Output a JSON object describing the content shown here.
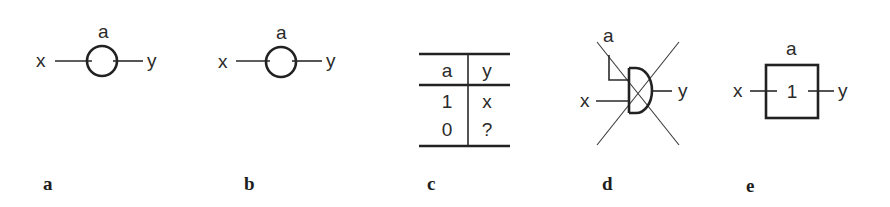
{
  "figure": {
    "panels": [
      {
        "id": "a",
        "caption": "a",
        "type": "circle-switch",
        "input_label": "x",
        "output_label": "y",
        "control_label": "a"
      },
      {
        "id": "b",
        "caption": "b",
        "type": "circle-switch",
        "input_label": "x",
        "output_label": "y",
        "control_label": "a"
      },
      {
        "id": "c",
        "caption": "c",
        "type": "truth-table",
        "headers": [
          "a",
          "y"
        ],
        "rows": [
          [
            "1",
            "x"
          ],
          [
            "0",
            "?"
          ]
        ]
      },
      {
        "id": "d",
        "caption": "d",
        "type": "crossed-out-and-gate",
        "input_label": "x",
        "output_label": "y",
        "control_label": "a"
      },
      {
        "id": "e",
        "caption": "e",
        "type": "box-switch",
        "input_label": "x",
        "output_label": "y",
        "control_label": "a",
        "box_label": "1"
      }
    ]
  },
  "colors": {
    "ink": "#2a2a2a",
    "background": "#ffffff"
  }
}
